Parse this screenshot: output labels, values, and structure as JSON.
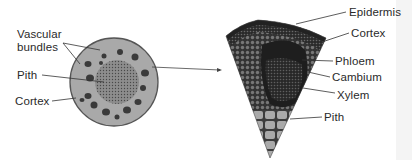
{
  "figure": {
    "left_panel": {
      "title": "Stem cross-section (whole)",
      "labels": {
        "vascular_1": "Vascular",
        "vascular_2": "bundles",
        "pith": "Pith",
        "cortex": "Cortex"
      }
    },
    "right_panel": {
      "title": "Enlarged wedge section",
      "labels": {
        "epidermis": "Epidermis",
        "cortex": "Cortex",
        "phloem": "Phloem",
        "cambium": "Cambium",
        "xylem": "Xylem",
        "pith": "Pith"
      }
    },
    "colors": {
      "stem_fill": "#a9a9a9",
      "stem_outline": "#555555",
      "pith_fill": "#8a8a8a",
      "bundle_fill": "#3a3a3a",
      "wedge_dark": "#1e1e1e",
      "wedge_mid": "#5a5a5a",
      "wedge_pith": "#a5a5a5",
      "leader_line": "#333333",
      "text": "#2a2a2a"
    }
  }
}
